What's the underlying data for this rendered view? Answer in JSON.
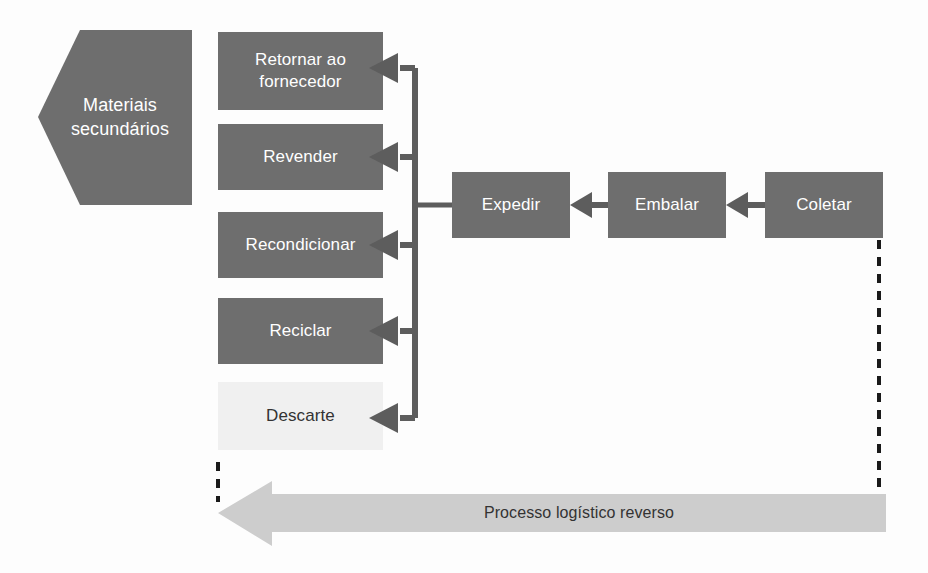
{
  "diagram": {
    "title": "Processo logístico reverso",
    "colors": {
      "box_fill": "#6e6e6e",
      "box_fill_light": "#f0f0f0",
      "connector": "#5d5d5d",
      "banner_fill": "#cdcdcd",
      "label_light": "#ffffff",
      "label_dark": "#333333",
      "background": "#fdfdfd",
      "dashed": "#1a1a1a"
    },
    "source_node": {
      "id": "materiais-secundarios",
      "label": "Materiais\nsecundários",
      "label_line1": "Materiais",
      "label_line2": "secundários",
      "shape": "left-pointing-pentagon",
      "fill": "#6e6e6e",
      "text_color": "#ffffff"
    },
    "disposition_nodes": [
      {
        "id": "retornar-ao-fornecedor",
        "label": "Retornar ao\nfornecedor",
        "line1": "Retornar ao",
        "line2": "fornecedor",
        "fill": "#6e6e6e",
        "text_color": "#ffffff"
      },
      {
        "id": "revender",
        "label": "Revender",
        "line1": "Revender",
        "line2": "",
        "fill": "#6e6e6e",
        "text_color": "#ffffff"
      },
      {
        "id": "recondicionar",
        "label": "Recondicionar",
        "line1": "Recondicionar",
        "line2": "",
        "fill": "#6e6e6e",
        "text_color": "#ffffff"
      },
      {
        "id": "reciclar",
        "label": "Reciclar",
        "line1": "Reciclar",
        "line2": "",
        "fill": "#6e6e6e",
        "text_color": "#ffffff"
      },
      {
        "id": "descarte",
        "label": "Descarte",
        "line1": "Descarte",
        "line2": "",
        "fill": "#f0f0f0",
        "text_color": "#333333"
      }
    ],
    "process_nodes": [
      {
        "id": "expedir",
        "label": "Expedir",
        "fill": "#6e6e6e",
        "text_color": "#ffffff"
      },
      {
        "id": "embalar",
        "label": "Embalar",
        "fill": "#6e6e6e",
        "text_color": "#ffffff"
      },
      {
        "id": "coletar",
        "label": "Coletar",
        "fill": "#6e6e6e",
        "text_color": "#ffffff"
      }
    ],
    "banner": {
      "id": "processo-logistico-reverso",
      "label": "Processo logístico reverso",
      "direction": "right-to-left",
      "fill": "#cdcdcd",
      "text_color": "#333333"
    },
    "flow_order": [
      "Coletar",
      "Embalar",
      "Expedir",
      "Retornar ao fornecedor / Revender / Recondicionar / Reciclar / Descarte",
      "Materiais secundários"
    ]
  }
}
